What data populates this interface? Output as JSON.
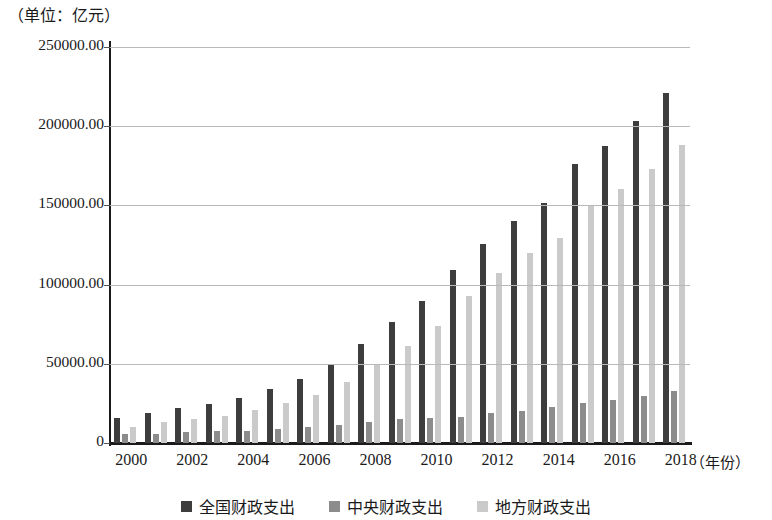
{
  "unit_caption": "（单位：亿元）",
  "x_axis_title": "（年份）",
  "legend": [
    {
      "label": "全国财政支出",
      "color": "#3d3d3d",
      "key": "national"
    },
    {
      "label": "中央财政支出",
      "color": "#8c8c8c",
      "key": "central"
    },
    {
      "label": "地方财政支出",
      "color": "#cacaca",
      "key": "local"
    }
  ],
  "y_tick_labels": [
    "250000.00",
    "200000.00",
    "150000.00",
    "100000.00",
    "50000.00",
    "0"
  ],
  "x_tick_labels": [
    "2000",
    "2002",
    "2004",
    "2006",
    "2008",
    "2010",
    "2012",
    "2014",
    "2016",
    "2018"
  ],
  "chart_data": {
    "type": "bar",
    "title": "",
    "subtitle": "",
    "xlabel": "（年份）",
    "ylabel": "（单位：亿元）",
    "ylim": [
      0,
      250000
    ],
    "yticks": [
      0,
      50000,
      100000,
      150000,
      200000,
      250000
    ],
    "grid": true,
    "legend_position": "bottom-center",
    "categories": [
      "2000",
      "2001",
      "2002",
      "2003",
      "2004",
      "2005",
      "2006",
      "2007",
      "2008",
      "2009",
      "2010",
      "2011",
      "2012",
      "2013",
      "2014",
      "2015",
      "2016",
      "2017",
      "2018"
    ],
    "xtick_display": [
      "2000",
      "",
      "2002",
      "",
      "2004",
      "",
      "2006",
      "",
      "2008",
      "",
      "2010",
      "",
      "2012",
      "",
      "2014",
      "",
      "2016",
      "",
      "2018"
    ],
    "series": [
      {
        "name": "全国财政支出",
        "color": "#3d3d3d",
        "values": [
          15887,
          18903,
          22053,
          24650,
          28487,
          33930,
          40423,
          49781,
          62593,
          76300,
          89874,
          109248,
          125953,
          140212,
          151786,
          175878,
          187755,
          203085,
          220906
        ]
      },
      {
        "name": "中央财政支出",
        "color": "#8c8c8c",
        "values": [
          5520,
          5768,
          6772,
          7420,
          7894,
          8776,
          9991,
          11442,
          13344,
          15256,
          15990,
          16514,
          18765,
          20472,
          22570,
          25542,
          27404,
          29859,
          32708
        ]
      },
      {
        "name": "地方财政支出",
        "color": "#cacaca",
        "values": [
          10367,
          13135,
          15281,
          17230,
          20593,
          25154,
          30431,
          38339,
          49248,
          61044,
          73884,
          92734,
          107188,
          119740,
          129216,
          150336,
          160351,
          173228,
          188198
        ]
      }
    ]
  }
}
